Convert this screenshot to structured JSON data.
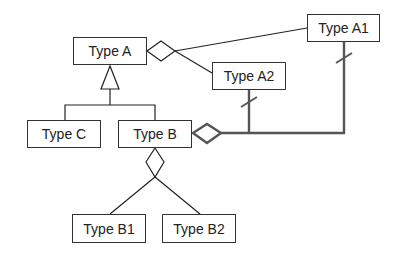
{
  "diagram": {
    "type": "UML class diagram",
    "classes": [
      {
        "id": "type_a",
        "label": "Type A",
        "x": 73,
        "y": 37,
        "w": 74,
        "h": 28
      },
      {
        "id": "type_a1",
        "label": "Type A1",
        "x": 307,
        "y": 14,
        "w": 73,
        "h": 28
      },
      {
        "id": "type_a2",
        "label": "Type A2",
        "x": 212,
        "y": 62,
        "w": 74,
        "h": 28
      },
      {
        "id": "type_c",
        "label": "Type C",
        "x": 27,
        "y": 120,
        "w": 74,
        "h": 28
      },
      {
        "id": "type_b",
        "label": "Type B",
        "x": 118,
        "y": 120,
        "w": 74,
        "h": 28
      },
      {
        "id": "type_b1",
        "label": "Type B1",
        "x": 72,
        "y": 214,
        "w": 74,
        "h": 29
      },
      {
        "id": "type_b2",
        "label": "Type B2",
        "x": 162,
        "y": 214,
        "w": 74,
        "h": 29
      }
    ],
    "relationships": [
      {
        "kind": "aggregation",
        "whole": "Type A",
        "parts": [
          "Type A1",
          "Type A2"
        ]
      },
      {
        "kind": "generalization",
        "parent": "Type A",
        "children": [
          "Type C",
          "Type B"
        ]
      },
      {
        "kind": "aggregation",
        "whole": "Type B",
        "parts": [
          "Type B1",
          "Type B2"
        ]
      },
      {
        "kind": "aggregation",
        "whole": "Type B",
        "parts": [
          "Type A1",
          "Type A2"
        ],
        "emphasized": true,
        "part_end_marker": "slash"
      }
    ],
    "colors": {
      "line": "#222222",
      "emphasis_line": "#555555",
      "text": "#222222",
      "background": "#ffffff"
    }
  }
}
